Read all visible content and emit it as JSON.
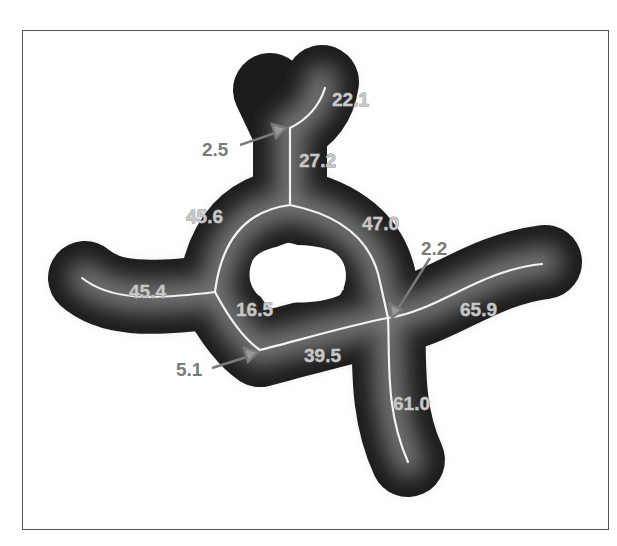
{
  "figure": {
    "colors": {
      "background": "#ffffff",
      "frame": "#555555",
      "blob_dark": "#1a1a1a",
      "blob_light": "#8a8a8a",
      "skeleton": "#f2f2f2",
      "label": "#c8c8c8",
      "callout": "#7a7a7a"
    },
    "branch_labels": [
      {
        "id": "b1",
        "text": "22.1"
      },
      {
        "id": "b2",
        "text": "27.2"
      },
      {
        "id": "b3",
        "text": "45.6"
      },
      {
        "id": "b4",
        "text": "47.0"
      },
      {
        "id": "b5",
        "text": "45.4"
      },
      {
        "id": "b6",
        "text": "16.5"
      },
      {
        "id": "b7",
        "text": "65.9"
      },
      {
        "id": "b8",
        "text": "39.5"
      },
      {
        "id": "b9",
        "text": "61.0"
      }
    ],
    "callout_labels": [
      {
        "id": "c1",
        "text": "2.5"
      },
      {
        "id": "c2",
        "text": "2.2"
      },
      {
        "id": "c3",
        "text": "5.1"
      }
    ]
  }
}
